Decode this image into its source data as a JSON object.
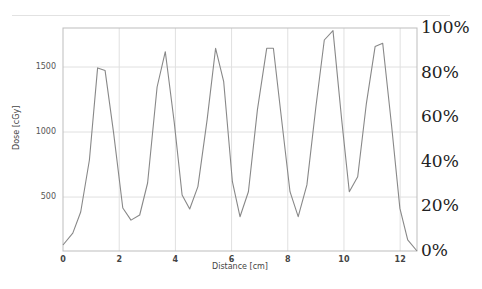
{
  "chart_data": {
    "type": "line",
    "title": "",
    "xlabel": "Distance [cm]",
    "ylabel": "Dose [cGy]",
    "y2label": "",
    "xlim": [
      0,
      12.6
    ],
    "ylim": [
      85,
      1800
    ],
    "y2lim": [
      0,
      100
    ],
    "grid": true,
    "legend": "none",
    "x_ticks": [
      "0",
      "2",
      "4",
      "6",
      "8",
      "10",
      "12"
    ],
    "y_ticks": [
      "500",
      "1000",
      "1500"
    ],
    "y2_ticks": [
      "0%",
      "20%",
      "40%",
      "60%",
      "80%",
      "100%"
    ],
    "series": [
      {
        "name": "Dose profile",
        "color": "#888888",
        "x": [
          0.0,
          0.35,
          0.63,
          0.94,
          1.23,
          1.5,
          1.8,
          2.13,
          2.42,
          2.73,
          3.01,
          3.35,
          3.64,
          3.96,
          4.24,
          4.51,
          4.8,
          5.13,
          5.43,
          5.72,
          6.03,
          6.3,
          6.6,
          6.92,
          7.25,
          7.49,
          7.75,
          8.08,
          8.37,
          8.68,
          9.0,
          9.3,
          9.61,
          9.92,
          10.19,
          10.49,
          10.8,
          11.11,
          11.38,
          11.7,
          11.99,
          12.27,
          12.6
        ],
        "values": [
          131,
          223,
          385,
          785,
          1493,
          1472,
          993,
          416,
          323,
          362,
          608,
          1346,
          1618,
          1070,
          516,
          408,
          580,
          1093,
          1644,
          1387,
          618,
          349,
          541,
          1170,
          1644,
          1644,
          1156,
          541,
          349,
          593,
          1195,
          1708,
          1780,
          1093,
          541,
          656,
          1221,
          1657,
          1682,
          1041,
          413,
          170,
          85
        ]
      }
    ]
  }
}
